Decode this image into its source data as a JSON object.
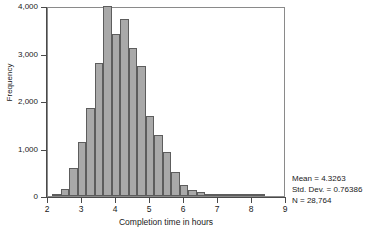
{
  "chart_data": {
    "type": "bar",
    "title": "",
    "subtitle": "",
    "xlabel": "Completion time in hours",
    "ylabel": "Frequency",
    "xlim": [
      2,
      9
    ],
    "ylim": [
      0,
      4000
    ],
    "grid": false,
    "legend": null,
    "bin_width": 0.25,
    "xticks": [
      "2",
      "3",
      "4",
      "5",
      "6",
      "7",
      "8",
      "9"
    ],
    "xtick_values": [
      2,
      3,
      4,
      5,
      6,
      7,
      8,
      9
    ],
    "yticks": [
      "0",
      "1,000",
      "2,000",
      "3,000",
      "4,000"
    ],
    "ytick_values": [
      0,
      1000,
      2000,
      3000,
      4000
    ],
    "bin_starts": [
      2.125,
      2.375,
      2.625,
      2.875,
      3.125,
      3.375,
      3.625,
      3.875,
      4.125,
      4.375,
      4.625,
      4.875,
      5.125,
      5.375,
      5.625,
      5.875,
      6.125,
      6.375,
      6.625,
      6.875,
      7.125,
      7.375,
      7.625,
      7.875,
      8.125
    ],
    "bin_centers": [
      2.25,
      2.5,
      2.75,
      3.0,
      3.25,
      3.5,
      3.75,
      4.0,
      4.25,
      4.5,
      4.75,
      5.0,
      5.25,
      5.5,
      5.75,
      6.0,
      6.25,
      6.5,
      6.75,
      7.0,
      7.25,
      7.5,
      7.75,
      8.0,
      8.25
    ],
    "values": [
      40,
      150,
      580,
      1140,
      1860,
      2810,
      3990,
      3420,
      3720,
      3110,
      2740,
      1690,
      1290,
      930,
      510,
      230,
      120,
      95,
      40,
      25,
      15,
      10,
      8,
      5,
      3
    ],
    "annotations": [
      "Mean = 4.3263",
      "Std. Dev. = 0.76386",
      "N = 28,764"
    ]
  },
  "stats": {
    "mean_label": "Mean = 4.3263",
    "sd_label": "Std. Dev. = 0.76386",
    "n_label": "N = 28,764"
  },
  "axes": {
    "y_title": "Frequency",
    "x_title": "Completion time in hours"
  },
  "colors": {
    "bar_fill": "#a9a9a9",
    "bar_border": "#5d5d5d",
    "axis": "#4a4a4a",
    "text": "#1a1a1a",
    "background": "#ffffff"
  }
}
